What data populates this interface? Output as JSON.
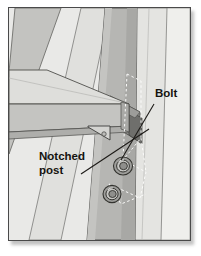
{
  "figure": {
    "domain": "technical-illustration",
    "frame": {
      "border_color": "#4a4a4a",
      "background_color": "#e9e9e7",
      "shadow_color": "#787878"
    },
    "palette": {
      "paper": "#e9e9e7",
      "light_face": "#e4e4e1",
      "pale_face": "#ededea",
      "mid_face": "#c9c9c6",
      "post_face": "#b3b3b0",
      "post_shade": "#a6a6a3",
      "beam_top": "#dcdcd9",
      "beam_front": "#c2c2bf",
      "beam_edge": "#b0b0ad",
      "notch_dark": "#7d7d7a",
      "notch_darker": "#6a6a67",
      "outline": "#3d3d3b",
      "hidden_line": "#ffffff",
      "label_text": "#15130f",
      "leader_line": "#1c1a17"
    },
    "labels": [
      {
        "id": "bolt",
        "text": "Bolt",
        "x": 146,
        "y": 89,
        "leader": {
          "from_x": 145,
          "from_y": 96,
          "to_x": 112,
          "to_y": 152,
          "note": "leader from Bolt caption down-left to upper bolt head"
        }
      },
      {
        "id": "notched-post",
        "text_line_1": "Notched",
        "text_line_2": "post",
        "x": 30,
        "y": 152,
        "x2": 30,
        "y2": 166,
        "leader": {
          "from_x": 72,
          "from_y": 166,
          "to_x": 140,
          "to_y": 121,
          "note": "leader from Notched post caption up-right to the notch in the post"
        }
      }
    ],
    "hardware": {
      "bolts": [
        {
          "id": "bolt-upper",
          "cx": 114,
          "cy": 158,
          "r_outer": 9.5,
          "r_mid": 6.5,
          "r_inner": 4.0
        },
        {
          "id": "bolt-lower",
          "cx": 103,
          "cy": 186,
          "r_outer": 9.0,
          "r_mid": 6.2,
          "r_inner": 3.8
        }
      ],
      "bracket": {
        "id": "beam-end-bracket",
        "note": "small angled metal bracket with fastener under the beam end",
        "x": 79,
        "y": 118,
        "width": 22,
        "height": 14
      }
    },
    "members": [
      {
        "id": "diagonal-brace-far-left",
        "note": "mid-gray diagonal band entering from top-left"
      },
      {
        "id": "diagonal-brace-second",
        "note": "pale diagonal band right of the first"
      },
      {
        "id": "notched-post",
        "note": "main diagonal post running top-center to bottom-center, notched at the beam"
      },
      {
        "id": "horizontal-beam",
        "note": "beam entering from the left, resting in the post notch"
      },
      {
        "id": "vertical-member-right",
        "note": "light vertical member on the right side"
      },
      {
        "id": "vertical-member-far-right",
        "note": "palest vertical member at the far right edge"
      }
    ],
    "hidden_detail": {
      "note": "white dashed hidden-lines showing the concealed bolt path and notch geometry behind the post"
    }
  }
}
